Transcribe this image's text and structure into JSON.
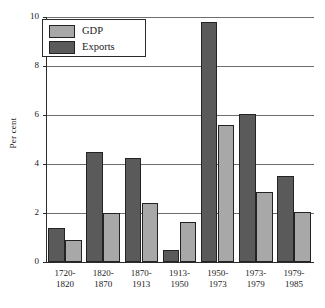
{
  "chart_data": {
    "type": "bar",
    "title": "",
    "xlabel": "",
    "ylabel": "Per cent",
    "ylim": [
      0,
      10
    ],
    "yticks": [
      0,
      2,
      4,
      6,
      8,
      10
    ],
    "ytick_labels": [
      "0",
      "2",
      "4",
      "6",
      "8",
      "10"
    ],
    "grid": true,
    "legend_position": "top-left",
    "categories": [
      "1720-1820",
      "1820-1870",
      "1870-1913",
      "1913-1950",
      "1950-1973",
      "1973-1979",
      "1979-1985"
    ],
    "category_lines": [
      [
        "1720-",
        "1820"
      ],
      [
        "1820-",
        "1870"
      ],
      [
        "1870-",
        "1913"
      ],
      [
        "1913-",
        "1950"
      ],
      [
        "1950-",
        "1973"
      ],
      [
        "1973-",
        "1979"
      ],
      [
        "1979-",
        "1985"
      ]
    ],
    "series": [
      {
        "name": "Exports",
        "color": "#5a5a5a",
        "values": [
          1.4,
          4.5,
          4.25,
          0.5,
          9.8,
          6.05,
          3.5
        ]
      },
      {
        "name": "GDP",
        "color": "#a8a8a8",
        "values": [
          0.9,
          2.0,
          2.4,
          1.65,
          5.6,
          2.85,
          2.05
        ]
      }
    ]
  },
  "legend": {
    "items": [
      {
        "label": "GDP",
        "color": "#a8a8a8"
      },
      {
        "label": "Exports",
        "color": "#5a5a5a"
      }
    ]
  },
  "axis": {
    "y_label": "Per cent"
  }
}
